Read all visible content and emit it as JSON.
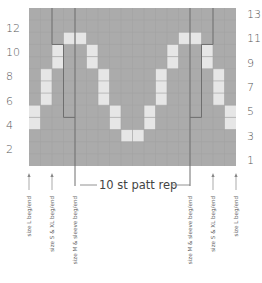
{
  "chart_data": {
    "type": "heatmap",
    "title": "",
    "columns": 18,
    "rows": 13,
    "colors": {
      "background": "#ababab",
      "contrast": "#e6e6e6",
      "grid": "#a2a2a2",
      "rep_line": "#6e6e6e",
      "text": "#555555"
    },
    "left_row_labels": [
      "12",
      "10",
      "8",
      "6",
      "4",
      "2"
    ],
    "left_row_numbers": [
      12,
      10,
      8,
      6,
      4,
      2
    ],
    "right_row_labels": [
      "13",
      "11",
      "9",
      "7",
      "5",
      "3",
      "1"
    ],
    "right_row_numbers": [
      13,
      11,
      9,
      7,
      5,
      3,
      1
    ],
    "contrast_cells": [
      {
        "row": 11,
        "cols": [
          4,
          5,
          14,
          15
        ]
      },
      {
        "row": 10,
        "cols": [
          3,
          6,
          13,
          16
        ]
      },
      {
        "row": 9,
        "cols": [
          3,
          6,
          13,
          16
        ]
      },
      {
        "row": 8,
        "cols": [
          2,
          7,
          12,
          17
        ]
      },
      {
        "row": 7,
        "cols": [
          2,
          7,
          12,
          17
        ]
      },
      {
        "row": 6,
        "cols": [
          2,
          7,
          12,
          17
        ]
      },
      {
        "row": 5,
        "cols": [
          1,
          8,
          11,
          18
        ]
      },
      {
        "row": 4,
        "cols": [
          1,
          8,
          11,
          18
        ]
      },
      {
        "row": 3,
        "cols": [
          9,
          10
        ]
      }
    ],
    "repeat": {
      "label": "10 st patt rep",
      "start_col": 5,
      "end_col": 14
    },
    "size_markers_left": [
      {
        "label": "size L beg/end",
        "col_edge": 0
      },
      {
        "label": "size S & XL beg/end",
        "col_edge": 2
      },
      {
        "label": "size M & sleeve beg/end",
        "col_edge": 4
      }
    ],
    "size_markers_right": [
      {
        "label": "size M & sleeve beg/end",
        "col_edge": 14
      },
      {
        "label": "size S & XL beg/end",
        "col_edge": 16
      },
      {
        "label": "size L beg/end",
        "col_edge": 18
      }
    ]
  }
}
